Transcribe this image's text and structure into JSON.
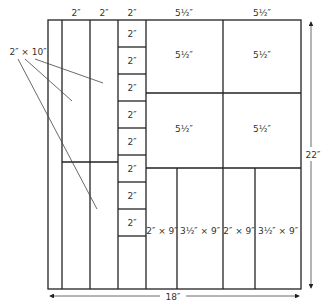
{
  "diagram": {
    "type": "quilt-layout",
    "overall": {
      "width_label": "18″",
      "height_label": "22″"
    },
    "top_labels": [
      "2″",
      "2″",
      "2″",
      "5½″",
      "5½″"
    ],
    "strip_callout": "2″ × 10″",
    "square_column": [
      "2″",
      "2″",
      "2″",
      "2″",
      "2″",
      "2″",
      "2″",
      "2″"
    ],
    "big_squares": [
      "5½″",
      "5½″",
      "5½″",
      "5½″"
    ],
    "bottom_rects": [
      "2″ × 9″",
      "3½″ × 9″",
      "2″ × 9″",
      "3½″ × 9″"
    ],
    "colors": {
      "line": "#222222",
      "text": "#333333",
      "background": "#ffffff"
    }
  }
}
